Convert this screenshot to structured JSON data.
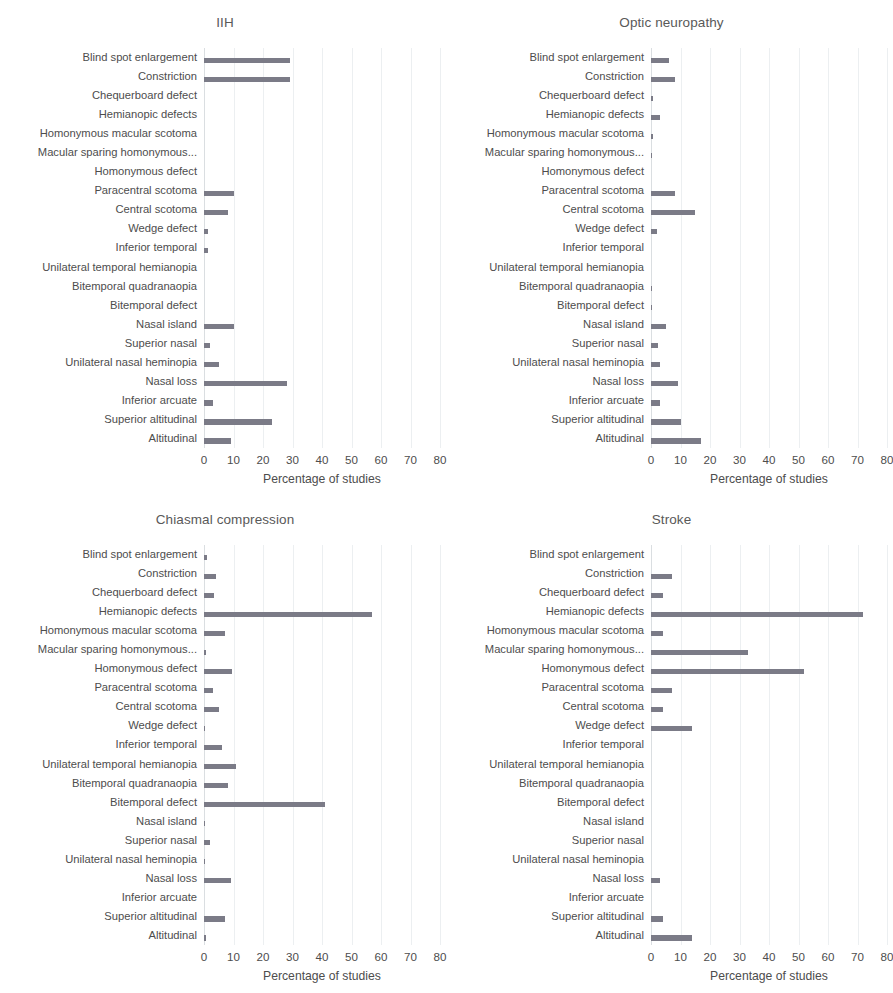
{
  "figure": {
    "categories": [
      "Blind spot enlargement",
      "Constriction",
      "Chequerboard defect",
      "Hemianopic defects",
      "Homonymous macular scotoma",
      "Macular sparing homonymous...",
      "Homonymous defect",
      "Paracentral scotoma",
      "Central scotoma",
      "Wedge defect",
      "Inferior temporal",
      "Unilateral temporal hemianopia",
      "Bitemporal quadranaopia",
      "Bitemporal defect",
      "Nasal island",
      "Superior nasal",
      "Unilateral nasal heminopia",
      "Nasal loss",
      "Inferior arcuate",
      "Superior altitudinal",
      "Altitudinal"
    ],
    "xaxis": {
      "label": "Percentage of studies",
      "ticks": [
        "0",
        "10",
        "20",
        "30",
        "40",
        "50",
        "60",
        "70",
        "80"
      ],
      "min": 0,
      "max": 80
    },
    "bar_color": "#7b7b87",
    "gridline_color": "#eceff1"
  },
  "chart_data": [
    {
      "type": "bar",
      "title": "IIH",
      "xlabel": "Percentage of studies",
      "ylabel": "",
      "xlim": [
        0,
        80
      ],
      "grid": true,
      "orientation": "horizontal",
      "categories": [
        "Blind spot enlargement",
        "Constriction",
        "Chequerboard defect",
        "Hemianopic defects",
        "Homonymous macular scotoma",
        "Macular sparing homonymous...",
        "Homonymous defect",
        "Paracentral scotoma",
        "Central scotoma",
        "Wedge defect",
        "Inferior temporal",
        "Unilateral temporal hemianopia",
        "Bitemporal quadranaopia",
        "Bitemporal defect",
        "Nasal island",
        "Superior nasal",
        "Unilateral nasal heminopia",
        "Nasal loss",
        "Inferior arcuate",
        "Superior altitudinal",
        "Altitudinal"
      ],
      "values": [
        29,
        4,
        29,
        0,
        0,
        0,
        0,
        10,
        8,
        1.5,
        1.5,
        1.5,
        0,
        0,
        10,
        2,
        5,
        28,
        3,
        23,
        9
      ]
    },
    {
      "type": "bar",
      "title": "Optic neuropathy",
      "xlabel": "Percentage of studies",
      "ylabel": "",
      "xlim": [
        0,
        80
      ],
      "grid": true,
      "orientation": "horizontal",
      "categories": [
        "Blind spot enlargement",
        "Constriction",
        "Chequerboard defect",
        "Hemianopic defects",
        "Homonymous macular scotoma",
        "Macular sparing homonymous...",
        "Homonymous defect",
        "Paracentral scotoma",
        "Central scotoma",
        "Wedge defect",
        "Inferior temporal",
        "Unilateral temporal hemianopia",
        "Bitemporal quadranaopia",
        "Bitemporal defect",
        "Nasal island",
        "Superior nasal",
        "Unilateral nasal heminopia",
        "Nasal loss",
        "Inferior arcuate",
        "Superior altitudinal",
        "Altitudinal"
      ],
      "values": [
        6,
        8,
        7,
        0.7,
        0,
        3,
        0.8,
        0.4,
        8,
        13,
        15,
        1.5,
        2,
        0,
        0,
        0,
        0.5,
        0.4,
        5,
        2.5,
        3,
        0,
        9,
        2,
        3,
        10,
        7,
        9,
        17
      ]
    },
    {
      "type": "bar",
      "title": "Chiasmal compression",
      "xlabel": "Percentage of studies",
      "ylabel": "",
      "xlim": [
        0,
        80
      ],
      "grid": true,
      "orientation": "horizontal",
      "categories": [
        "Blind spot enlargement",
        "Constriction",
        "Chequerboard defect",
        "Hemianopic defects",
        "Homonymous macular scotoma",
        "Macular sparing homonymous...",
        "Homonymous defect",
        "Paracentral scotoma",
        "Central scotoma",
        "Wedge defect",
        "Inferior temporal",
        "Unilateral temporal hemianopia",
        "Bitemporal quadranaopia",
        "Bitemporal defect",
        "Nasal island",
        "Superior nasal",
        "Unilateral nasal heminopia",
        "Nasal loss",
        "Inferior arcuate",
        "Superior altitudinal",
        "Altitudinal"
      ],
      "values": [
        1,
        2,
        4,
        3.5,
        30,
        57,
        7,
        0.8,
        7,
        9.5,
        3,
        1.5,
        0.5,
        5,
        0.5,
        0.4,
        6,
        2,
        6,
        11,
        1.5,
        8,
        30,
        4,
        41,
        0.5,
        0.5,
        2,
        0.5,
        0.5,
        9,
        0,
        7,
        0,
        0.7
      ]
    },
    {
      "type": "bar",
      "title": "Stroke",
      "xlabel": "Percentage of studies",
      "ylabel": "",
      "xlim": [
        0,
        80
      ],
      "grid": true,
      "orientation": "horizontal",
      "categories": [
        "Blind spot enlargement",
        "Constriction",
        "Chequerboard defect",
        "Hemianopic defects",
        "Homonymous macular scotoma",
        "Macular sparing homonymous...",
        "Homonymous defect",
        "Paracentral scotoma",
        "Central scotoma",
        "Wedge defect",
        "Inferior temporal",
        "Unilateral temporal hemianopia",
        "Bitemporal quadranaopia",
        "Bitemporal defect",
        "Nasal island",
        "Superior nasal",
        "Unilateral nasal heminopia",
        "Nasal loss",
        "Inferior arcuate",
        "Superior altitudinal",
        "Altitudinal"
      ],
      "values": [
        0,
        7,
        3,
        4,
        72,
        4,
        4,
        33,
        8,
        52,
        0,
        7,
        0,
        4,
        14,
        0,
        0,
        0,
        0,
        0,
        0,
        0,
        0,
        0,
        3,
        0,
        0,
        4,
        3,
        14
      ]
    }
  ],
  "panels": [
    {
      "title": "IIH",
      "bars": [
        29,
        4,
        29,
        0,
        0,
        0,
        0,
        0,
        0,
        0,
        0,
        10,
        0,
        8,
        1.5,
        1.5,
        0,
        0,
        0,
        0,
        10,
        2,
        5,
        0,
        28,
        3,
        23,
        9
      ],
      "series": [
        {
          "cat": "Blind spot enlargement",
          "v": 29
        },
        {
          "cat": "Constriction",
          "v": 29
        },
        {
          "cat": "Chequerboard defect",
          "v": 0
        },
        {
          "cat": "Hemianopic defects",
          "v": 0
        },
        {
          "cat": "Homonymous macular scotoma",
          "v": 0
        },
        {
          "cat": "Macular sparing homonymous...",
          "v": 0
        },
        {
          "cat": "Homonymous defect",
          "v": 0
        },
        {
          "cat": "Paracentral scotoma",
          "v": 10
        },
        {
          "cat": "Central scotoma",
          "v": 8
        },
        {
          "cat": "Wedge defect",
          "v": 1.5
        },
        {
          "cat": "Inferior temporal",
          "v": 1.5
        },
        {
          "cat": "Unilateral temporal hemianopia",
          "v": 0
        },
        {
          "cat": "Bitemporal quadranaopia",
          "v": 0
        },
        {
          "cat": "Bitemporal defect",
          "v": 0
        },
        {
          "cat": "Nasal island",
          "v": 10
        },
        {
          "cat": "Superior nasal",
          "v": 2
        },
        {
          "cat": "Unilateral nasal heminopia",
          "v": 5
        },
        {
          "cat": "Nasal loss",
          "v": 28
        },
        {
          "cat": "Inferior arcuate",
          "v": 3
        },
        {
          "cat": "Superior altitudinal",
          "v": 23
        },
        {
          "cat": "Altitudinal",
          "v": 9
        }
      ]
    },
    {
      "title": "Optic neuropathy",
      "series": [
        {
          "cat": "Blind spot enlargement",
          "v": 6
        },
        {
          "cat": "Constriction",
          "v": 8
        },
        {
          "cat": "Chequerboard defect",
          "v": 0.7
        },
        {
          "cat": "Hemianopic defects",
          "v": 3
        },
        {
          "cat": "Homonymous macular scotoma",
          "v": 0.8
        },
        {
          "cat": "Macular sparing homonymous...",
          "v": 0.4
        },
        {
          "cat": "Homonymous defect",
          "v": 0
        },
        {
          "cat": "Paracentral scotoma",
          "v": 8
        },
        {
          "cat": "Central scotoma",
          "v": 15
        },
        {
          "cat": "Wedge defect",
          "v": 2
        },
        {
          "cat": "Inferior temporal",
          "v": 0
        },
        {
          "cat": "Unilateral temporal hemianopia",
          "v": 0
        },
        {
          "cat": "Bitemporal quadranaopia",
          "v": 0.5
        },
        {
          "cat": "Bitemporal defect",
          "v": 0.4
        },
        {
          "cat": "Nasal island",
          "v": 5
        },
        {
          "cat": "Superior nasal",
          "v": 2.5
        },
        {
          "cat": "Unilateral nasal heminopia",
          "v": 3
        },
        {
          "cat": "Nasal loss",
          "v": 9
        },
        {
          "cat": "Inferior arcuate",
          "v": 3
        },
        {
          "cat": "Superior altitudinal",
          "v": 10
        },
        {
          "cat": "Altitudinal",
          "v": 17
        }
      ]
    },
    {
      "title": "Chiasmal compression",
      "series": [
        {
          "cat": "Blind spot enlargement",
          "v": 1
        },
        {
          "cat": "Constriction",
          "v": 4
        },
        {
          "cat": "Chequerboard defect",
          "v": 3.5
        },
        {
          "cat": "Hemianopic defects",
          "v": 57
        },
        {
          "cat": "Homonymous macular scotoma",
          "v": 7
        },
        {
          "cat": "Macular sparing homonymous...",
          "v": 0.8
        },
        {
          "cat": "Homonymous defect",
          "v": 9.5
        },
        {
          "cat": "Paracentral scotoma",
          "v": 3
        },
        {
          "cat": "Central scotoma",
          "v": 5
        },
        {
          "cat": "Wedge defect",
          "v": 0.5
        },
        {
          "cat": "Inferior temporal",
          "v": 6
        },
        {
          "cat": "Unilateral temporal hemianopia",
          "v": 11
        },
        {
          "cat": "Bitemporal quadranaopia",
          "v": 8
        },
        {
          "cat": "Bitemporal defect",
          "v": 41
        },
        {
          "cat": "Nasal island",
          "v": 0.5
        },
        {
          "cat": "Superior nasal",
          "v": 2
        },
        {
          "cat": "Unilateral nasal heminopia",
          "v": 0.5
        },
        {
          "cat": "Nasal loss",
          "v": 9
        },
        {
          "cat": "Inferior arcuate",
          "v": 0
        },
        {
          "cat": "Superior altitudinal",
          "v": 7
        },
        {
          "cat": "Altitudinal",
          "v": 0.7
        }
      ]
    },
    {
      "title": "Stroke",
      "series": [
        {
          "cat": "Blind spot enlargement",
          "v": 0
        },
        {
          "cat": "Constriction",
          "v": 7
        },
        {
          "cat": "Chequerboard defect",
          "v": 4
        },
        {
          "cat": "Hemianopic defects",
          "v": 72
        },
        {
          "cat": "Homonymous macular scotoma",
          "v": 4
        },
        {
          "cat": "Macular sparing homonymous...",
          "v": 33
        },
        {
          "cat": "Homonymous defect",
          "v": 52
        },
        {
          "cat": "Paracentral scotoma",
          "v": 7
        },
        {
          "cat": "Central scotoma",
          "v": 4
        },
        {
          "cat": "Wedge defect",
          "v": 14
        },
        {
          "cat": "Inferior temporal",
          "v": 0
        },
        {
          "cat": "Unilateral temporal hemianopia",
          "v": 0
        },
        {
          "cat": "Bitemporal quadranaopia",
          "v": 0
        },
        {
          "cat": "Bitemporal defect",
          "v": 0
        },
        {
          "cat": "Nasal island",
          "v": 0
        },
        {
          "cat": "Superior nasal",
          "v": 0
        },
        {
          "cat": "Unilateral nasal heminopia",
          "v": 0
        },
        {
          "cat": "Nasal loss",
          "v": 3
        },
        {
          "cat": "Inferior arcuate",
          "v": 0
        },
        {
          "cat": "Superior altitudinal",
          "v": 4
        },
        {
          "cat": "Altitudinal",
          "v": 14
        }
      ]
    }
  ]
}
